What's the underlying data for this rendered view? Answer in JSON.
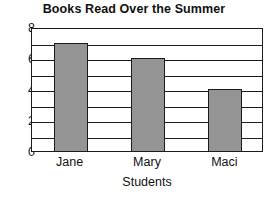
{
  "chart_data": {
    "type": "bar",
    "title": "Books Read Over the Summer",
    "xlabel": "Students",
    "ylabel": "",
    "categories": [
      "Jane",
      "Mary",
      "Maci"
    ],
    "values": [
      7,
      6,
      4
    ],
    "ylim": [
      0,
      8
    ],
    "ytick_labels": [
      "0",
      "2",
      "4",
      "6",
      "8"
    ],
    "ytick_values": [
      0,
      2,
      4,
      6,
      8
    ],
    "gridline_step": 1,
    "grid": true,
    "grid_orientation": "horizontal",
    "legend": null,
    "legend_position": "none",
    "bar_color": "#949494",
    "bar_edge_color": "#1b1b1b",
    "axis_color": "#1b1b1b",
    "background_color": "#ffffff",
    "text_color": "#111111"
  }
}
